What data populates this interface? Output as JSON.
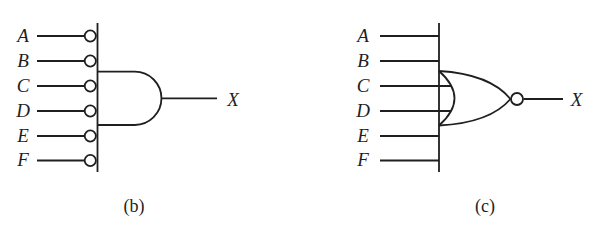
{
  "colors": {
    "ink": "#1f1f1f",
    "background": "#ffffff"
  },
  "diagrams": [
    {
      "caption": "(b)",
      "gate": "and-gate-with-inverted-inputs",
      "inputs": [
        "A",
        "B",
        "C",
        "D",
        "E",
        "F"
      ],
      "output_label": "X"
    },
    {
      "caption": "(c)",
      "gate": "nor-gate",
      "inputs": [
        "A",
        "B",
        "C",
        "D",
        "E",
        "F"
      ],
      "output_label": "X"
    }
  ]
}
